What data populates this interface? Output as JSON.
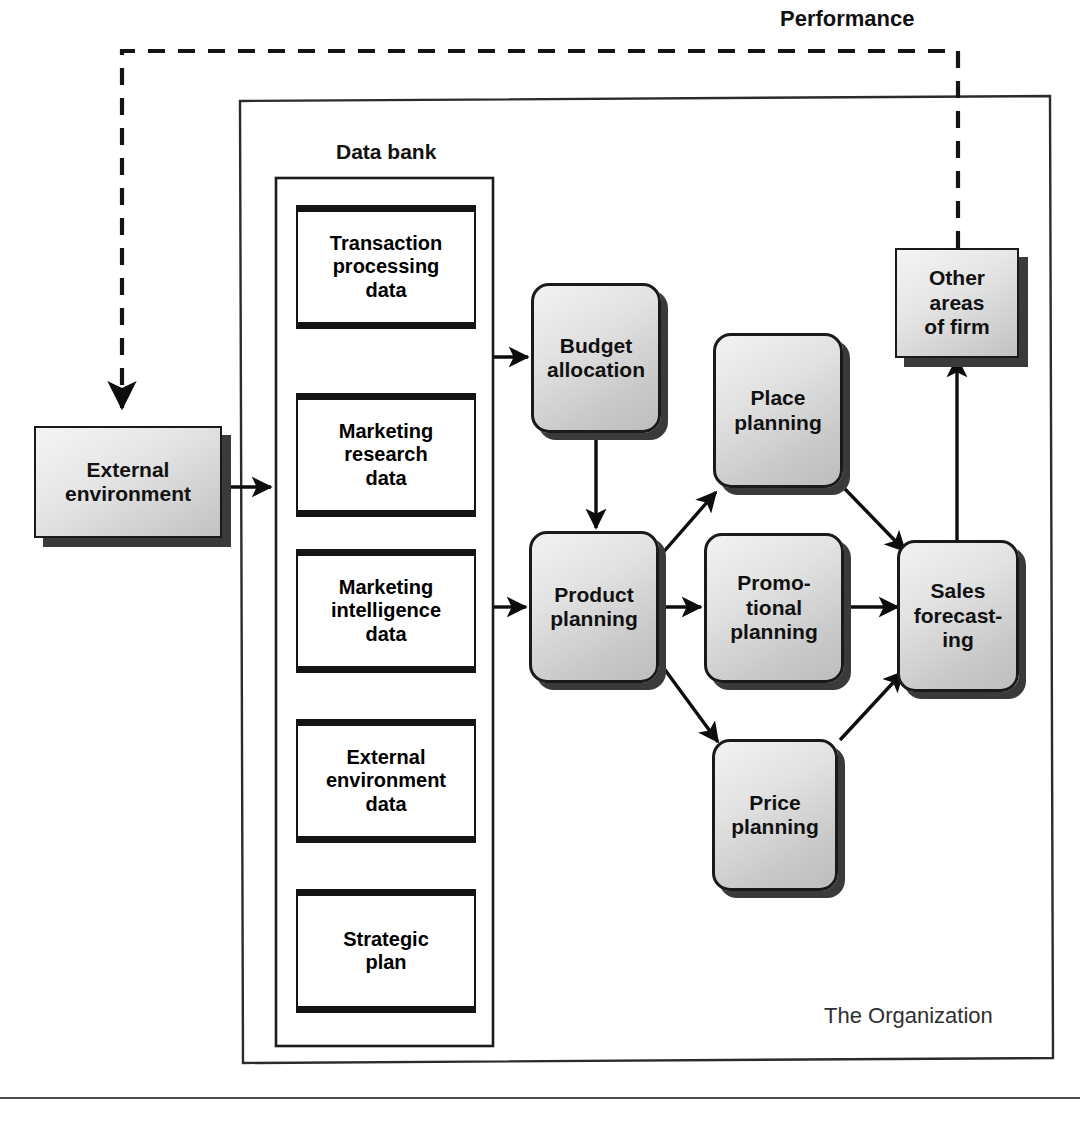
{
  "diagram": {
    "performance_label": "Performance",
    "organization_label": "The Organization",
    "data_bank_label": "Data bank",
    "external": {
      "label": "External\nenvironment",
      "name": "external-environment"
    },
    "other_areas": {
      "label": "Other\nareas\nof firm",
      "name": "other-areas-of-firm"
    },
    "data_bank_items": [
      {
        "label": "Transaction\nprocessing\ndata"
      },
      {
        "label": "Marketing\nresearch\ndata"
      },
      {
        "label": "Marketing\nintelligence\ndata"
      },
      {
        "label": "External\nenvironment\ndata"
      },
      {
        "label": "Strategic\nplan"
      }
    ],
    "processes": [
      {
        "id": "budget-allocation",
        "label": "Budget\nallocation"
      },
      {
        "id": "place-planning",
        "label": "Place\nplanning"
      },
      {
        "id": "product-planning",
        "label": "Product\nplanning"
      },
      {
        "id": "promotional-planning",
        "label": "Promo-\ntional\nplanning"
      },
      {
        "id": "price-planning",
        "label": "Price\nplanning"
      },
      {
        "id": "sales-forecasting",
        "label": "Sales\nforecast-\ning"
      }
    ],
    "connections": [
      {
        "from": "external-environment",
        "to": "data-bank",
        "style": "solid-arrow"
      },
      {
        "from": "data-bank",
        "to": "budget-allocation",
        "style": "solid-arrow"
      },
      {
        "from": "data-bank",
        "to": "product-planning",
        "style": "solid-arrow"
      },
      {
        "from": "budget-allocation",
        "to": "product-planning",
        "style": "solid-arrow"
      },
      {
        "from": "product-planning",
        "to": "place-planning",
        "style": "solid-arrow"
      },
      {
        "from": "product-planning",
        "to": "promotional-planning",
        "style": "solid-arrow"
      },
      {
        "from": "product-planning",
        "to": "price-planning",
        "style": "solid-arrow"
      },
      {
        "from": "place-planning",
        "to": "sales-forecasting",
        "style": "solid-arrow"
      },
      {
        "from": "promotional-planning",
        "to": "sales-forecasting",
        "style": "solid-arrow"
      },
      {
        "from": "price-planning",
        "to": "sales-forecasting",
        "style": "solid-arrow"
      },
      {
        "from": "sales-forecasting",
        "to": "other-areas-of-firm",
        "style": "solid-arrow"
      },
      {
        "from": "other-areas-of-firm",
        "to": "external-environment",
        "style": "dashed-arrow",
        "label": "Performance"
      }
    ],
    "colors": {
      "box_fill_light": "#f2f2f2",
      "box_fill_dark": "#bdbdbd",
      "shadow": "#3a3a3a",
      "stroke": "#1a1a1a",
      "background": "#ffffff",
      "org_label": "#2f2f2f"
    }
  }
}
